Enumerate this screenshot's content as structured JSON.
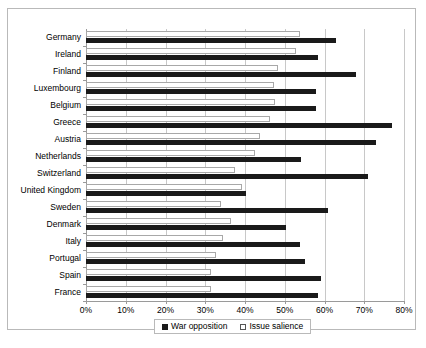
{
  "chart_data": {
    "type": "bar",
    "orientation": "horizontal",
    "title": "",
    "xlabel": "",
    "ylabel": "",
    "xlim": [
      0,
      80
    ],
    "xticks": [
      "0%",
      "10%",
      "20%",
      "30%",
      "40%",
      "50%",
      "60%",
      "70%",
      "80%"
    ],
    "xtick_values": [
      0,
      10,
      20,
      30,
      40,
      50,
      60,
      70,
      80
    ],
    "grid": true,
    "legend_position": "bottom",
    "categories": [
      "Germany",
      "Ireland",
      "Finland",
      "Luxembourg",
      "Belgium",
      "Greece",
      "Austria",
      "Netherlands",
      "Switzerland",
      "United Kingdom",
      "Sweden",
      "Denmark",
      "Italy",
      "Portugal",
      "Spain",
      "France"
    ],
    "series": [
      {
        "name": "War opposition",
        "color": "#1a1a1a",
        "values": [
          62.9,
          58.4,
          67.9,
          57.9,
          57.9,
          77.0,
          72.9,
          54.1,
          70.9,
          40.3,
          60.9,
          50.3,
          53.8,
          55.0,
          59.2,
          58.4
        ]
      },
      {
        "name": "Issue salience",
        "color": "#ffffff",
        "values": [
          53.8,
          52.8,
          48.3,
          47.3,
          47.5,
          46.3,
          43.7,
          42.4,
          37.5,
          39.2,
          34.0,
          36.4,
          34.5,
          32.8,
          31.5,
          31.5
        ]
      }
    ]
  },
  "legend": {
    "items": [
      {
        "label": "War opposition",
        "swatch": "filled-square"
      },
      {
        "label": "Issue salience",
        "swatch": "outlined-square"
      }
    ]
  },
  "colors": {
    "war_opposition": "#1a1a1a",
    "issue_salience": "#ffffff",
    "gridline": "#c8c8c8",
    "axis": "#9a9a9a",
    "frame": "#b9b9b9",
    "background": "#ffffff"
  }
}
